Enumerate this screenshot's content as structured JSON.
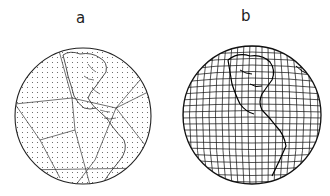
{
  "panels": [
    {
      "label": "a",
      "description": "Globe with icosahedral triangular grid and dotted nodes, Americas visible"
    },
    {
      "label": "b",
      "description": "Globe with dense latitude-longitude style curvilinear mesh, Americas visible"
    }
  ],
  "colors": {
    "ink": "#1a1a1a",
    "dots": "#555555",
    "background": "#ffffff"
  }
}
